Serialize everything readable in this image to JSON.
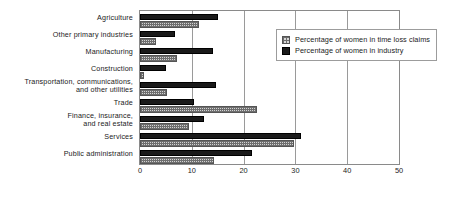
{
  "chart_data": {
    "type": "bar",
    "orientation": "horizontal",
    "title": "",
    "xlabel": "",
    "ylabel": "",
    "xlim": [
      0,
      50
    ],
    "xticks": [
      0,
      10,
      20,
      30,
      40,
      50
    ],
    "grid": true,
    "legend_position": "top-right",
    "categories": [
      "Agriculture",
      "Other primary industries",
      "Manufacturing",
      "Construction",
      "Transportation, communications,\nand other utilities",
      "Trade",
      "Finance, insurance,\nand real estate",
      "Services",
      "Public administration"
    ],
    "series": [
      {
        "name": "Percentage of women in industry",
        "style": "solid-dark",
        "color": "#1a1a1a",
        "values": [
          15.1,
          6.7,
          14.1,
          5.0,
          14.6,
          10.5,
          12.4,
          31.0,
          21.6
        ]
      },
      {
        "name": "Percentage of women in time loss claims",
        "style": "grid-hatch-light",
        "color": "#d2d2d2",
        "values": [
          11.3,
          3.0,
          7.1,
          0.8,
          5.2,
          22.6,
          9.4,
          29.7,
          14.2
        ]
      }
    ]
  },
  "legend": {
    "items": [
      {
        "label": "Percentage of women in time loss claims",
        "swatch": "light"
      },
      {
        "label": "Percentage of women in industry",
        "swatch": "dark"
      }
    ]
  },
  "axis": {
    "tick_labels": [
      "0",
      "10",
      "20",
      "30",
      "40",
      "50"
    ]
  }
}
